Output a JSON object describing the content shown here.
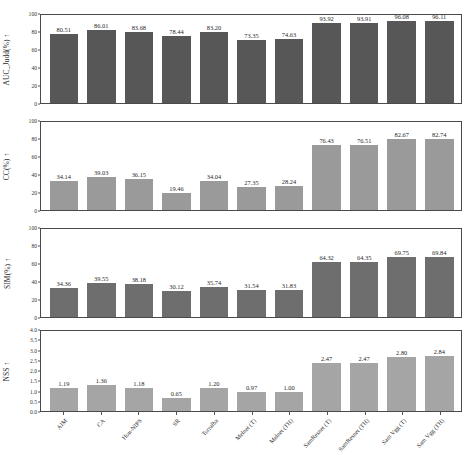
{
  "chart_data": [
    {
      "type": "bar",
      "title": "",
      "xlabel": "",
      "ylabel": "AUC_Judd(%) ↑",
      "ylim": [
        0,
        100
      ],
      "yticks": [
        "0",
        "20",
        "40",
        "60",
        "80",
        "100"
      ],
      "grid": false,
      "legend": "none",
      "bar_color": "#575757",
      "categories": [
        "AIM",
        "CA",
        "Hou-NIPS",
        "SR",
        "Torralba",
        "Melnet (T)",
        "Melnet (TH)",
        "SamResnet (T)",
        "SamResnet (TH)",
        "Sam Vgg (T)",
        "Sam Vgg (TH)"
      ],
      "values": [
        80.51,
        86.01,
        83.68,
        78.44,
        83.2,
        73.35,
        74.63,
        93.92,
        93.91,
        96.08,
        96.11
      ],
      "labels": [
        "80.51",
        "86.01",
        "83.68",
        "78.44",
        "83.20",
        "73.35",
        "74.63",
        "93.92",
        "93.91",
        "96.08",
        "96.11"
      ]
    },
    {
      "type": "bar",
      "title": "",
      "xlabel": "",
      "ylabel": "CC(%) ↑",
      "ylim": [
        0,
        100
      ],
      "yticks": [
        "0",
        "20",
        "40",
        "60",
        "80",
        "100"
      ],
      "grid": false,
      "legend": "none",
      "bar_color": "#9a9a9a",
      "categories": [
        "AIM",
        "CA",
        "Hou-NIPS",
        "SR",
        "Torralba",
        "Melnet (T)",
        "Melnet (TH)",
        "SamResnet (T)",
        "SamResnet (TH)",
        "Sam Vgg (T)",
        "Sam Vgg (TH)"
      ],
      "values": [
        34.14,
        39.03,
        36.15,
        19.46,
        34.04,
        27.35,
        28.24,
        76.43,
        76.51,
        82.67,
        82.74
      ],
      "labels": [
        "34.14",
        "39.03",
        "36.15",
        "19.46",
        "34.04",
        "27.35",
        "28.24",
        "76.43",
        "76.51",
        "82.67",
        "82.74"
      ]
    },
    {
      "type": "bar",
      "title": "",
      "xlabel": "",
      "ylabel": "SIM(%) ↑",
      "ylim": [
        0,
        100
      ],
      "yticks": [
        "0",
        "20",
        "40",
        "60",
        "80",
        "100"
      ],
      "grid": false,
      "legend": "none",
      "bar_color": "#6e6e6e",
      "categories": [
        "AIM",
        "CA",
        "Hou-NIPS",
        "SR",
        "Torralba",
        "Melnet (T)",
        "Melnet (TH)",
        "SamResnet (T)",
        "SamResnet (TH)",
        "Sam Vgg (T)",
        "Sam Vgg (TH)"
      ],
      "values": [
        34.36,
        39.55,
        38.18,
        30.12,
        35.74,
        31.54,
        31.83,
        64.32,
        64.35,
        69.75,
        69.84
      ],
      "labels": [
        "34.36",
        "39.55",
        "38.18",
        "30.12",
        "35.74",
        "31.54",
        "31.83",
        "64.32",
        "64.35",
        "69.75",
        "69.84"
      ]
    },
    {
      "type": "bar",
      "title": "",
      "xlabel": "",
      "ylabel": "NSS ↑",
      "ylim": [
        0,
        4.0
      ],
      "yticks": [
        "0.0",
        "0.5",
        "1.0",
        "1.5",
        "2.0",
        "2.5",
        "3.0",
        "3.5",
        "4.0"
      ],
      "grid": false,
      "legend": "none",
      "bar_color": "#a5a5a5",
      "categories": [
        "AIM",
        "CA",
        "Hou-NIPS",
        "SR",
        "Torralba",
        "Melnet (T)",
        "Melnet (TH)",
        "SamResnet (T)",
        "SamResnet (TH)",
        "Sam Vgg (T)",
        "Sam Vgg (TH)"
      ],
      "values": [
        1.19,
        1.36,
        1.18,
        0.65,
        1.2,
        0.97,
        1.0,
        2.47,
        2.47,
        2.8,
        2.84
      ],
      "labels": [
        "1.19",
        "1.36",
        "1.18",
        "0.65",
        "1.20",
        "0.97",
        "1.00",
        "2.47",
        "2.47",
        "2.80",
        "2.84"
      ]
    }
  ]
}
